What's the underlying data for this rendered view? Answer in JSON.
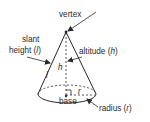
{
  "diagram": {
    "labels": {
      "vertex": "vertex",
      "slant_line1": "slant",
      "slant_line2_prefix": "height (",
      "slant_var": "l",
      "slant_suffix": ")",
      "altitude_prefix": "altitude (",
      "altitude_var": "h",
      "altitude_suffix": ")",
      "h_mark": "h",
      "l_mark": "l",
      "r_mark": "r",
      "base": "base",
      "radius_prefix": "radius (",
      "radius_var": "r",
      "radius_suffix": ")"
    },
    "colors": {
      "stroke": "#2a2a2a",
      "background": "#ffffff"
    }
  }
}
